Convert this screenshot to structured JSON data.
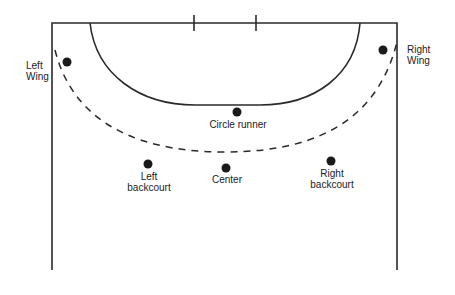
{
  "diagram": {
    "type": "handball-court-positions",
    "colors": {
      "line": "#2a2a2a",
      "player": "#1a1a1a",
      "text": "#222222",
      "background": "#ffffff"
    },
    "positions": [
      {
        "id": "left-wing",
        "line1": "Left",
        "line2": "Wing",
        "x": 67,
        "y": 62
      },
      {
        "id": "right-wing",
        "line1": "Right",
        "line2": "Wing",
        "x": 383,
        "y": 50
      },
      {
        "id": "circle-runner",
        "line1": "Circle runner",
        "line2": "",
        "x": 237,
        "y": 112
      },
      {
        "id": "left-backcourt",
        "line1": "Left",
        "line2": "backcourt",
        "x": 148,
        "y": 164
      },
      {
        "id": "center",
        "line1": "Center",
        "line2": "",
        "x": 226,
        "y": 168
      },
      {
        "id": "right-backcourt",
        "line1": "Right",
        "line2": "backcourt",
        "x": 331,
        "y": 161
      }
    ]
  }
}
